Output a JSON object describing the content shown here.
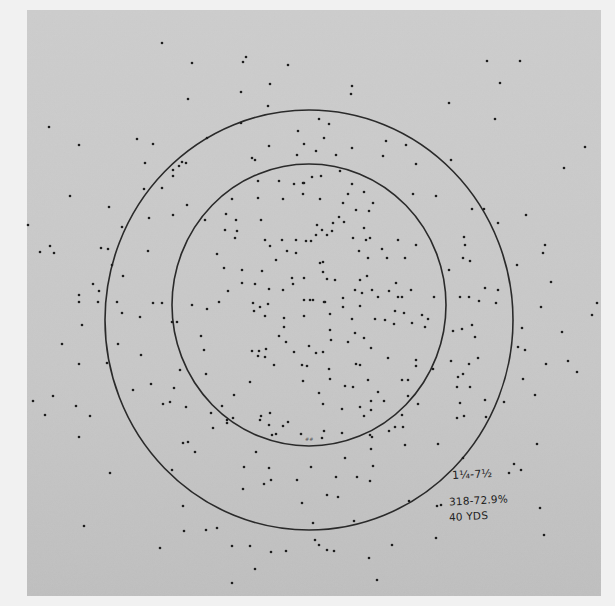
{
  "photo": {
    "description": "Shotgun pellet pattern test sheet with two concentric circles",
    "background_color": "#f1f1f1",
    "paper_color": "#c9c9c9",
    "ink_color": "#1e1e1e",
    "paper_bounds": {
      "x": 27,
      "y": 10,
      "w": 574,
      "h": 586
    }
  },
  "circles": {
    "outer": {
      "cx": 309,
      "cy": 320,
      "rx": 204,
      "ry": 210
    },
    "inner": {
      "cx": 309,
      "cy": 305,
      "rx": 137,
      "ry": 141
    }
  },
  "annotation": {
    "load": "1¼-7½",
    "count_percent": "318-72.9%",
    "distance": "40 YDS",
    "center_mark": "##"
  },
  "pellets": [
    [
      162,
      43
    ],
    [
      192,
      63
    ],
    [
      246,
      57
    ],
    [
      243,
      62
    ],
    [
      288,
      65
    ],
    [
      270,
      84
    ],
    [
      188,
      99
    ],
    [
      241,
      92
    ],
    [
      268,
      106
    ],
    [
      49,
      127
    ],
    [
      79,
      145
    ],
    [
      137,
      139
    ],
    [
      153,
      144
    ],
    [
      207,
      138
    ],
    [
      241,
      123
    ],
    [
      298,
      131
    ],
    [
      269,
      146
    ],
    [
      304,
      144
    ],
    [
      297,
      155
    ],
    [
      252,
      158
    ],
    [
      255,
      160
    ],
    [
      182,
      162
    ],
    [
      179,
      166
    ],
    [
      186,
      163
    ],
    [
      173,
      170
    ],
    [
      173,
      176
    ],
    [
      145,
      163
    ],
    [
      162,
      188
    ],
    [
      144,
      189
    ],
    [
      70,
      196
    ],
    [
      109,
      207
    ],
    [
      487,
      61
    ],
    [
      520,
      61
    ],
    [
      500,
      83
    ],
    [
      352,
      86
    ],
    [
      351,
      94
    ],
    [
      449,
      103
    ],
    [
      495,
      119
    ],
    [
      319,
      119
    ],
    [
      329,
      124
    ],
    [
      324,
      138
    ],
    [
      316,
      151
    ],
    [
      352,
      148
    ],
    [
      386,
      141
    ],
    [
      406,
      145
    ],
    [
      336,
      155
    ],
    [
      383,
      156
    ],
    [
      416,
      164
    ],
    [
      451,
      160
    ],
    [
      585,
      147
    ],
    [
      564,
      168
    ],
    [
      340,
      171
    ],
    [
      258,
      181
    ],
    [
      279,
      181
    ],
    [
      294,
      184
    ],
    [
      303,
      183
    ],
    [
      303,
      194
    ],
    [
      187,
      205
    ],
    [
      258,
      198
    ],
    [
      283,
      199
    ],
    [
      232,
      199
    ],
    [
      226,
      214
    ],
    [
      236,
      220
    ],
    [
      261,
      220
    ],
    [
      173,
      215
    ],
    [
      205,
      220
    ],
    [
      237,
      231
    ],
    [
      225,
      230
    ],
    [
      265,
      240
    ],
    [
      282,
      240
    ],
    [
      235,
      238
    ],
    [
      270,
      246
    ],
    [
      296,
      240
    ],
    [
      306,
      241
    ],
    [
      287,
      251
    ],
    [
      296,
      253
    ],
    [
      276,
      260
    ],
    [
      217,
      254
    ],
    [
      224,
      268
    ],
    [
      242,
      270
    ],
    [
      262,
      271
    ],
    [
      242,
      283
    ],
    [
      255,
      284
    ],
    [
      269,
      289
    ],
    [
      292,
      278
    ],
    [
      293,
      284
    ],
    [
      304,
      278
    ],
    [
      228,
      291
    ],
    [
      283,
      290
    ],
    [
      192,
      305
    ],
    [
      219,
      302
    ],
    [
      268,
      304
    ],
    [
      304,
      300
    ],
    [
      312,
      177
    ],
    [
      321,
      176
    ],
    [
      304,
      183
    ],
    [
      352,
      184
    ],
    [
      348,
      194
    ],
    [
      364,
      192
    ],
    [
      320,
      199
    ],
    [
      413,
      194
    ],
    [
      436,
      196
    ],
    [
      343,
      203
    ],
    [
      373,
      203
    ],
    [
      356,
      210
    ],
    [
      369,
      211
    ],
    [
      339,
      217
    ],
    [
      344,
      222
    ],
    [
      333,
      223
    ],
    [
      317,
      225
    ],
    [
      322,
      230
    ],
    [
      332,
      231
    ],
    [
      316,
      235
    ],
    [
      327,
      235
    ],
    [
      364,
      228
    ],
    [
      353,
      238
    ],
    [
      366,
      240
    ],
    [
      370,
      238
    ],
    [
      311,
      241
    ],
    [
      398,
      240
    ],
    [
      416,
      245
    ],
    [
      359,
      251
    ],
    [
      382,
      249
    ],
    [
      405,
      258
    ],
    [
      387,
      258
    ],
    [
      368,
      258
    ],
    [
      320,
      263
    ],
    [
      323,
      262
    ],
    [
      323,
      272
    ],
    [
      335,
      280
    ],
    [
      360,
      280
    ],
    [
      367,
      276
    ],
    [
      327,
      279
    ],
    [
      396,
      283
    ],
    [
      372,
      290
    ],
    [
      355,
      290
    ],
    [
      362,
      293
    ],
    [
      389,
      291
    ],
    [
      411,
      290
    ],
    [
      398,
      297
    ],
    [
      378,
      297
    ],
    [
      343,
      298
    ],
    [
      310,
      300
    ],
    [
      313,
      300
    ],
    [
      325,
      302
    ],
    [
      343,
      307
    ],
    [
      402,
      297
    ],
    [
      434,
      297
    ],
    [
      207,
      309
    ],
    [
      253,
      303
    ],
    [
      260,
      307
    ],
    [
      254,
      311
    ],
    [
      265,
      316
    ],
    [
      304,
      316
    ],
    [
      284,
      318
    ],
    [
      172,
      322
    ],
    [
      177,
      322
    ],
    [
      284,
      327
    ],
    [
      201,
      336
    ],
    [
      279,
      336
    ],
    [
      286,
      342
    ],
    [
      204,
      350
    ],
    [
      252,
      351
    ],
    [
      259,
      351
    ],
    [
      258,
      356
    ],
    [
      266,
      349
    ],
    [
      294,
      352
    ],
    [
      265,
      357
    ],
    [
      302,
      365
    ],
    [
      274,
      365
    ],
    [
      307,
      366
    ],
    [
      180,
      370
    ],
    [
      206,
      374
    ],
    [
      303,
      381
    ],
    [
      250,
      382
    ],
    [
      234,
      395
    ],
    [
      174,
      388
    ],
    [
      186,
      407
    ],
    [
      170,
      402
    ],
    [
      270,
      413
    ],
    [
      222,
      406
    ],
    [
      260,
      420
    ],
    [
      233,
      418
    ],
    [
      288,
      422
    ],
    [
      213,
      428
    ],
    [
      283,
      426
    ],
    [
      227,
      423
    ],
    [
      272,
      435
    ],
    [
      188,
      442
    ],
    [
      301,
      434
    ],
    [
      324,
      302
    ],
    [
      360,
      306
    ],
    [
      330,
      314
    ],
    [
      352,
      319
    ],
    [
      375,
      319
    ],
    [
      385,
      320
    ],
    [
      395,
      311
    ],
    [
      404,
      313
    ],
    [
      422,
      315
    ],
    [
      428,
      319
    ],
    [
      394,
      324
    ],
    [
      412,
      323
    ],
    [
      425,
      327
    ],
    [
      330,
      330
    ],
    [
      355,
      333
    ],
    [
      331,
      340
    ],
    [
      364,
      338
    ],
    [
      348,
      342
    ],
    [
      371,
      348
    ],
    [
      309,
      346
    ],
    [
      316,
      353
    ],
    [
      323,
      352
    ],
    [
      388,
      358
    ],
    [
      356,
      364
    ],
    [
      416,
      360
    ],
    [
      416,
      366
    ],
    [
      329,
      369
    ],
    [
      360,
      365
    ],
    [
      330,
      379
    ],
    [
      368,
      380
    ],
    [
      408,
      380
    ],
    [
      433,
      369
    ],
    [
      402,
      380
    ],
    [
      345,
      386
    ],
    [
      353,
      387
    ],
    [
      378,
      392
    ],
    [
      408,
      396
    ],
    [
      319,
      393
    ],
    [
      371,
      401
    ],
    [
      384,
      401
    ],
    [
      323,
      404
    ],
    [
      360,
      407
    ],
    [
      342,
      409
    ],
    [
      418,
      404
    ],
    [
      371,
      410
    ],
    [
      402,
      415
    ],
    [
      364,
      416
    ],
    [
      395,
      427
    ],
    [
      389,
      431
    ],
    [
      324,
      431
    ],
    [
      403,
      427
    ],
    [
      322,
      438
    ],
    [
      342,
      433
    ],
    [
      370,
      435
    ],
    [
      405,
      445
    ],
    [
      438,
      444
    ],
    [
      28,
      225
    ],
    [
      122,
      227
    ],
    [
      149,
      218
    ],
    [
      40,
      252
    ],
    [
      50,
      246
    ],
    [
      54,
      253
    ],
    [
      101,
      248
    ],
    [
      108,
      249
    ],
    [
      148,
      251
    ],
    [
      112,
      265
    ],
    [
      93,
      284
    ],
    [
      123,
      276
    ],
    [
      79,
      295
    ],
    [
      99,
      291
    ],
    [
      79,
      302
    ],
    [
      98,
      302
    ],
    [
      117,
      302
    ],
    [
      153,
      303
    ],
    [
      162,
      303
    ],
    [
      122,
      313
    ],
    [
      140,
      317
    ],
    [
      82,
      325
    ],
    [
      62,
      344
    ],
    [
      118,
      344
    ],
    [
      141,
      355
    ],
    [
      79,
      364
    ],
    [
      107,
      363
    ],
    [
      133,
      390
    ],
    [
      151,
      384
    ],
    [
      33,
      401
    ],
    [
      53,
      396
    ],
    [
      76,
      406
    ],
    [
      90,
      416
    ],
    [
      45,
      415
    ],
    [
      163,
      404
    ],
    [
      472,
      209
    ],
    [
      484,
      209
    ],
    [
      526,
      215
    ],
    [
      498,
      223
    ],
    [
      464,
      237
    ],
    [
      465,
      245
    ],
    [
      545,
      245
    ],
    [
      543,
      253
    ],
    [
      463,
      258
    ],
    [
      470,
      261
    ],
    [
      517,
      265
    ],
    [
      449,
      270
    ],
    [
      485,
      288
    ],
    [
      498,
      290
    ],
    [
      551,
      282
    ],
    [
      460,
      297
    ],
    [
      469,
      297
    ],
    [
      479,
      301
    ],
    [
      496,
      303
    ],
    [
      541,
      307
    ],
    [
      597,
      303
    ],
    [
      592,
      315
    ],
    [
      472,
      325
    ],
    [
      462,
      329
    ],
    [
      453,
      331
    ],
    [
      522,
      328
    ],
    [
      475,
      337
    ],
    [
      562,
      332
    ],
    [
      518,
      347
    ],
    [
      525,
      350
    ],
    [
      451,
      361
    ],
    [
      469,
      364
    ],
    [
      478,
      358
    ],
    [
      546,
      364
    ],
    [
      568,
      361
    ],
    [
      577,
      372
    ],
    [
      523,
      379
    ],
    [
      463,
      374
    ],
    [
      458,
      377
    ],
    [
      470,
      387
    ],
    [
      535,
      395
    ],
    [
      457,
      387
    ],
    [
      485,
      400
    ],
    [
      504,
      402
    ],
    [
      460,
      403
    ],
    [
      457,
      418
    ],
    [
      464,
      416
    ],
    [
      486,
      417
    ],
    [
      537,
      444
    ],
    [
      79,
      437
    ],
    [
      183,
      443
    ],
    [
      195,
      452
    ],
    [
      211,
      413
    ],
    [
      227,
      420
    ],
    [
      261,
      416
    ],
    [
      269,
      425
    ],
    [
      276,
      434
    ],
    [
      256,
      452
    ],
    [
      172,
      470
    ],
    [
      244,
      467
    ],
    [
      269,
      468
    ],
    [
      243,
      489
    ],
    [
      264,
      484
    ],
    [
      297,
      480
    ],
    [
      311,
      467
    ],
    [
      302,
      503
    ],
    [
      271,
      480
    ],
    [
      183,
      506
    ],
    [
      110,
      473
    ],
    [
      84,
      526
    ],
    [
      206,
      530
    ],
    [
      217,
      528
    ],
    [
      184,
      531
    ],
    [
      250,
      546
    ],
    [
      232,
      546
    ],
    [
      160,
      548
    ],
    [
      271,
      552
    ],
    [
      286,
      551
    ],
    [
      255,
      569
    ],
    [
      232,
      583
    ],
    [
      313,
      523
    ],
    [
      372,
      437
    ],
    [
      371,
      449
    ],
    [
      345,
      458
    ],
    [
      373,
      466
    ],
    [
      336,
      477
    ],
    [
      357,
      477
    ],
    [
      370,
      481
    ],
    [
      327,
      495
    ],
    [
      338,
      497
    ],
    [
      409,
      501
    ],
    [
      437,
      506
    ],
    [
      514,
      464
    ],
    [
      521,
      470
    ],
    [
      509,
      473
    ],
    [
      463,
      458
    ],
    [
      441,
      505
    ],
    [
      540,
      508
    ],
    [
      354,
      521
    ],
    [
      544,
      535
    ],
    [
      436,
      538
    ],
    [
      315,
      540
    ],
    [
      319,
      545
    ],
    [
      327,
      550
    ],
    [
      334,
      551
    ],
    [
      392,
      545
    ],
    [
      369,
      558
    ],
    [
      377,
      580
    ]
  ]
}
